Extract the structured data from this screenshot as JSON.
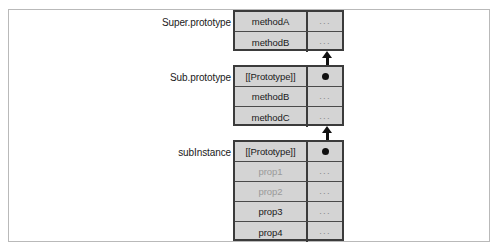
{
  "figure": {
    "colors": {
      "box_fill": "#d4d4d4",
      "box_border": "#3b3b3b",
      "row_divider": "#4a4a4a",
      "text": "#1a1a1a",
      "dim_text": "#9a9a9a",
      "ellipsis": "#888888",
      "arrow": "#111111",
      "frame_border": "#b9b9b9",
      "background": "#ffffff"
    },
    "ellipsis_glyph": "...",
    "objects": [
      {
        "id": "super-prototype",
        "label": "Super.prototype",
        "rows": [
          {
            "key": "methodA",
            "value": "...",
            "dim": false,
            "is_pointer": false
          },
          {
            "key": "methodB",
            "value": "...",
            "dim": false,
            "is_pointer": false
          }
        ]
      },
      {
        "id": "sub-prototype",
        "label": "Sub.prototype",
        "rows": [
          {
            "key": "[[Prototype]]",
            "value": "",
            "dim": false,
            "is_pointer": true
          },
          {
            "key": "methodB",
            "value": "...",
            "dim": false,
            "is_pointer": false
          },
          {
            "key": "methodC",
            "value": "...",
            "dim": false,
            "is_pointer": false
          }
        ]
      },
      {
        "id": "sub-instance",
        "label": "subInstance",
        "rows": [
          {
            "key": "[[Prototype]]",
            "value": "",
            "dim": false,
            "is_pointer": true
          },
          {
            "key": "prop1",
            "value": "...",
            "dim": true,
            "is_pointer": false
          },
          {
            "key": "prop2",
            "value": "...",
            "dim": true,
            "is_pointer": false
          },
          {
            "key": "prop3",
            "value": "...",
            "dim": false,
            "is_pointer": false
          },
          {
            "key": "prop4",
            "value": "...",
            "dim": false,
            "is_pointer": false
          }
        ]
      }
    ],
    "links": [
      {
        "id": "link-sub-to-super",
        "from": "sub-prototype.[[Prototype]]",
        "to": "super-prototype"
      },
      {
        "id": "link-instance-to-sub",
        "from": "sub-instance.[[Prototype]]",
        "to": "sub-prototype"
      }
    ]
  }
}
